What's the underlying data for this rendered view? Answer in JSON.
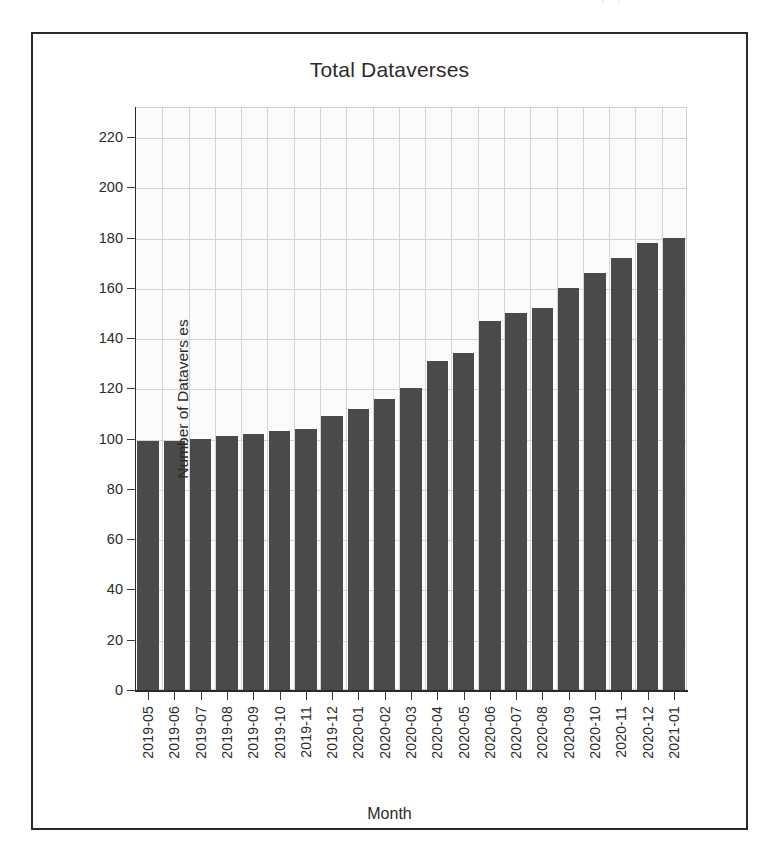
{
  "scan_artifact": {
    "top_left_fragment": "...",
    "top_right_fragment": "(...)"
  },
  "figure": {
    "title": "Total Dataverses",
    "x_axis_title": "Month",
    "y_axis_title": "Number of Dataverses",
    "y_axis_title_rendered": "Number of Datavers es"
  },
  "chart_data": {
    "type": "bar",
    "title": "Total Dataverses",
    "xlabel": "Month",
    "ylabel": "Number of Dataverses",
    "ylim": [
      0,
      232
    ],
    "xlim_categories": 21,
    "grid": true,
    "legend": null,
    "bar_color": "#4a4a4a",
    "plot_background": "#fbfbfb",
    "frame_color": "#2b2b2b",
    "y_ticks": [
      0,
      20,
      40,
      60,
      80,
      100,
      120,
      140,
      160,
      180,
      200,
      220
    ],
    "categories": [
      "2019-05",
      "2019-06",
      "2019-07",
      "2019-08",
      "2019-09",
      "2019-10",
      "2019-11",
      "2019-12",
      "2020-01",
      "2020-02",
      "2020-03",
      "2020-04",
      "2020-05",
      "2020-06",
      "2020-07",
      "2020-08",
      "2020-09",
      "2020-10",
      "2020-11",
      "2020-12",
      "2021-01"
    ],
    "values": [
      99,
      99,
      100,
      101,
      102,
      103,
      104,
      109,
      112,
      116,
      120,
      131,
      134,
      147,
      150,
      152,
      160,
      166,
      172,
      178,
      180
    ]
  }
}
